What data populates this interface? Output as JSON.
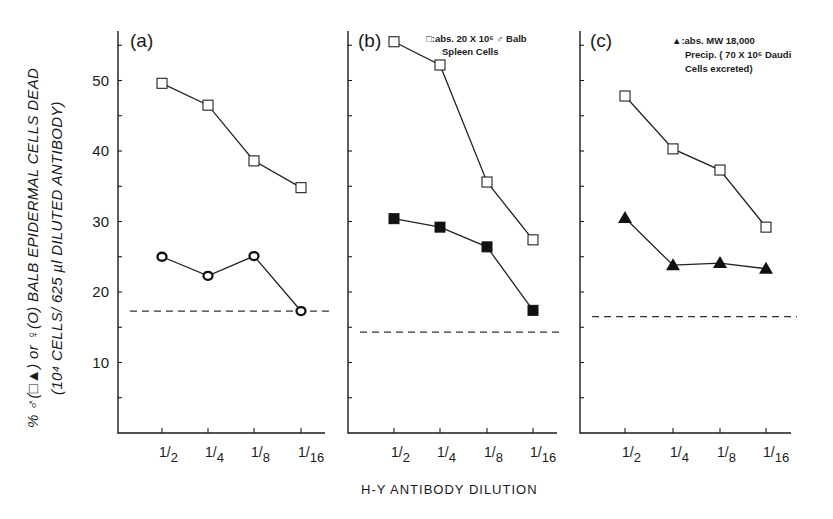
{
  "chart_data": {
    "type": "line",
    "xlabel": "H-Y ANTIBODY DILUTION",
    "ylabel_line1": "% ♂(□▲) or ♀(O) BALB EPIDERMAL CELLS DEAD",
    "ylabel_line2": "(10⁴ CELLS/ 625 µl DILUTED ANTIBODY)",
    "ylim": [
      0,
      56
    ],
    "yticks": [
      10,
      20,
      30,
      40,
      50
    ],
    "grid": false,
    "categories": [
      "1/2",
      "1/4",
      "1/8",
      "1/16"
    ],
    "panels": [
      {
        "label": "(a)",
        "legend": [],
        "baseline_dashed": 17.3,
        "series": [
          {
            "name": "♂ (open square)",
            "marker": "open-square",
            "values": [
              49.6,
              46.5,
              38.6,
              34.8
            ]
          },
          {
            "name": "♀ (open circle)",
            "marker": "circle",
            "values": [
              25.0,
              22.3,
              25.1,
              17.3
            ]
          }
        ]
      },
      {
        "label": "(b)",
        "legend": [
          "□:abs. 20 X 10⁶ ♂ Balb",
          "Spleen Cells"
        ],
        "baseline_dashed": 14.3,
        "series": [
          {
            "name": "♂ (open square)",
            "marker": "open-square",
            "values": [
              55.5,
              52.2,
              35.6,
              27.4
            ]
          },
          {
            "name": "♂ abs. spleen cells (filled square)",
            "marker": "filled-square",
            "values": [
              30.4,
              29.2,
              26.4,
              17.4
            ]
          }
        ]
      },
      {
        "label": "(c)",
        "legend": [
          "▲:abs. MW 18,000",
          "Precip. ( 70 X 10⁶ Daudi",
          "Cells excreted)"
        ],
        "baseline_dashed": 16.5,
        "series": [
          {
            "name": "♂ (open square)",
            "marker": "open-square",
            "values": [
              47.8,
              40.3,
              37.3,
              29.2
            ]
          },
          {
            "name": "♂ abs. MW 18,000 precip. (filled triangle)",
            "marker": "triangle",
            "values": [
              30.5,
              23.8,
              24.1,
              23.3
            ]
          }
        ]
      }
    ]
  },
  "layout": {
    "y0": 433,
    "px_per_unit": 7.05,
    "top": 31,
    "panels": [
      {
        "x0": 118,
        "x1": 325,
        "xs": [
          162,
          208,
          254,
          301
        ]
      },
      {
        "x0": 348,
        "x1": 557,
        "xs": [
          394,
          440,
          487,
          533
        ]
      },
      {
        "x0": 580,
        "x1": 791,
        "xs": [
          625,
          673,
          720,
          766
        ]
      }
    ]
  }
}
